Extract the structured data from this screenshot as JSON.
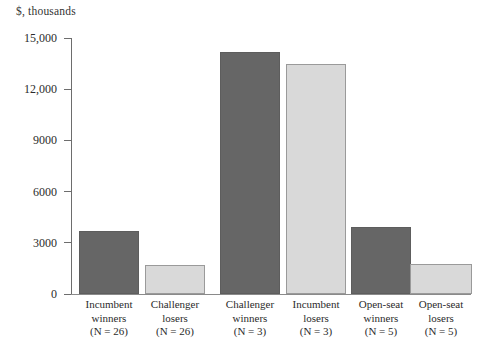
{
  "chart_data": {
    "type": "bar",
    "title": "$, thousands",
    "xlabel": "",
    "ylabel": "$, thousands",
    "ylim": [
      0,
      15000
    ],
    "grid": false,
    "legend": "none",
    "ytick_labels": [
      "15,000",
      "12,000",
      "9000",
      "6000",
      "3000",
      "0"
    ],
    "ytick_values": [
      15000,
      12000,
      9000,
      6000,
      3000,
      0
    ],
    "categories": [
      "Incumbent winners (N = 26)",
      "Challenger losers (N = 26)",
      "Challenger winners (N = 3)",
      "Incumbent losers (N = 3)",
      "Open-seat winners (N = 5)",
      "Open-seat losers (N = 5)"
    ],
    "values": [
      3700,
      1700,
      14200,
      13500,
      3900,
      1750
    ],
    "bars": [
      {
        "line1": "Incumbent",
        "line2": "winners",
        "line3": "(N = 26)",
        "value": 3700,
        "style": "dark",
        "group": 1
      },
      {
        "line1": "Challenger",
        "line2": "losers",
        "line3": "(N = 26)",
        "value": 1700,
        "style": "light",
        "group": 1
      },
      {
        "line1": "Challenger",
        "line2": "winners",
        "line3": "(N = 3)",
        "value": 14200,
        "style": "dark",
        "group": 2
      },
      {
        "line1": "Incumbent",
        "line2": "losers",
        "line3": "(N = 3)",
        "value": 13500,
        "style": "light",
        "group": 2
      },
      {
        "line1": "Open-seat",
        "line2": "winners",
        "line3": "(N = 5)",
        "value": 3900,
        "style": "dark",
        "group": 3
      },
      {
        "line1": "Open-seat",
        "line2": "losers",
        "line3": "(N = 5)",
        "value": 1750,
        "style": "light",
        "group": 3
      }
    ],
    "colors": {
      "dark_bar": "#666666",
      "light_bar": "#d9d9d9",
      "light_bar_border": "#9a9a9a",
      "axis": "#6d6d6d",
      "text": "#2b2b2b",
      "background": "#ffffff"
    }
  }
}
